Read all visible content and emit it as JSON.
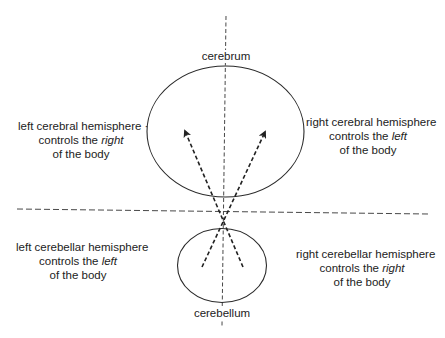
{
  "structures": {
    "cerebrum": "cerebrum",
    "cerebellum": "cerebellum"
  },
  "annotations": {
    "left_cerebral": {
      "line1": "left cerebral hemisphere ·",
      "line2_prefix": "controls the ",
      "line2_emph": "right",
      "line3": "of the body"
    },
    "right_cerebral": {
      "line1": "right cerebral hemisphere",
      "line2_prefix": "controls the ",
      "line2_emph": "left",
      "line3": "of the body"
    },
    "left_cerebellar": {
      "line1": "left cerebellar hemisphere",
      "line2_prefix": "controls the ",
      "line2_emph": "left",
      "line3": "of the body"
    },
    "right_cerebellar": {
      "line1": "right cerebellar hemisphere",
      "line2_prefix": "controls the ",
      "line2_emph": "right",
      "line3": "of the body"
    }
  },
  "style": {
    "stroke_color": "#2a2a2a",
    "background": "#ffffff"
  }
}
